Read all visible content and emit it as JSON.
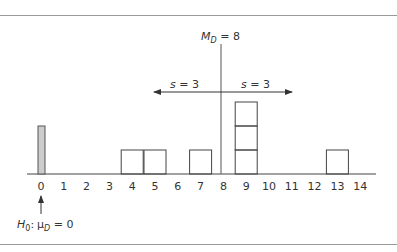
{
  "figure": {
    "median_label": {
      "var": "M",
      "sub": "D",
      "eq": " = 8"
    },
    "s_left": {
      "var": "s",
      "eq": " = 3"
    },
    "s_right": {
      "var": "s",
      "eq": " = 3"
    },
    "h0_label": {
      "h": "H",
      "h_sub": "0",
      "colon": ":",
      "mu": "μ",
      "mu_sub": "D",
      "eq": " = 0"
    },
    "colors": {
      "line": "#444444",
      "shaded_bar": "#cccccc",
      "rule": "#9a9a9a"
    }
  },
  "chart_data": {
    "type": "bar",
    "title": "",
    "xlabel": "",
    "ylabel": "",
    "categories": [
      "0",
      "1",
      "2",
      "3",
      "4",
      "5",
      "6",
      "7",
      "8",
      "9",
      "10",
      "11",
      "12",
      "13",
      "14"
    ],
    "frequencies": [
      0,
      0,
      0,
      0,
      1,
      1,
      0,
      1,
      0,
      3,
      0,
      0,
      0,
      1,
      0
    ],
    "series": [
      {
        "name": "difference scores (box per score)",
        "values": [
          0,
          0,
          0,
          0,
          1,
          1,
          0,
          1,
          0,
          3,
          0,
          0,
          0,
          1,
          0
        ]
      }
    ],
    "annotations": [
      {
        "text": "M_D = 8",
        "x": 8,
        "type": "vertical line"
      },
      {
        "text": "s = 3",
        "from": 8,
        "to": 5,
        "type": "left arrow"
      },
      {
        "text": "s = 3",
        "from": 8,
        "to": 11,
        "type": "right arrow"
      },
      {
        "text": "H0: μD = 0",
        "x": 0,
        "type": "upward arrow with shaded reference bar"
      }
    ],
    "xlim": [
      0,
      14
    ],
    "ylim": [
      0,
      3
    ],
    "grid": false,
    "legend": "none"
  }
}
